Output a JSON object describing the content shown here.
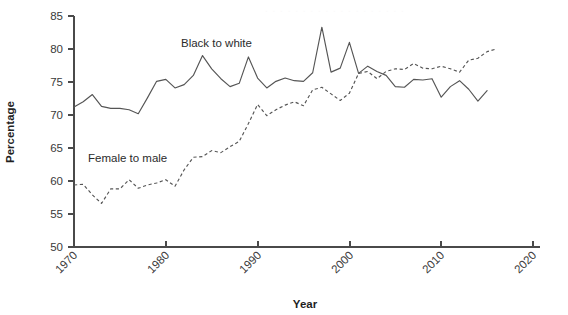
{
  "chart_data": {
    "type": "line",
    "title": "",
    "xlabel": "Year",
    "ylabel": "Percentage",
    "xlim": [
      1970,
      2020
    ],
    "ylim": [
      50,
      85
    ],
    "xticks": [
      1970,
      1980,
      1990,
      2000,
      2010,
      2020
    ],
    "xtick_labels": [
      "1970",
      "1980",
      "1990",
      "2000",
      "2010",
      "2020"
    ],
    "yticks": [
      50,
      55,
      60,
      65,
      70,
      75,
      80,
      85
    ],
    "ytick_labels": [
      "50",
      "55",
      "60",
      "65",
      "70",
      "75",
      "80",
      "85"
    ],
    "grid": false,
    "legend_position": "inline-annotation",
    "series": [
      {
        "name": "Black to white",
        "style": "solid",
        "color": "#555555",
        "annotation_label": "Black to white",
        "x": [
          1970,
          1971,
          1972,
          1973,
          1974,
          1975,
          1976,
          1977,
          1978,
          1979,
          1980,
          1981,
          1982,
          1983,
          1984,
          1985,
          1986,
          1987,
          1988,
          1989,
          1990,
          1991,
          1992,
          1993,
          1994,
          1995,
          1996,
          1997,
          1998,
          1999,
          2000,
          2001,
          2002,
          2003,
          2004,
          2005,
          2006,
          2007,
          2008,
          2009,
          2010,
          2011,
          2012,
          2013,
          2014,
          2015
        ],
        "values": [
          71.2,
          72.0,
          73.1,
          71.3,
          71.0,
          71.0,
          70.8,
          70.2,
          72.6,
          75.1,
          75.4,
          74.1,
          74.6,
          76.0,
          79.0,
          77.0,
          75.5,
          74.3,
          74.8,
          78.8,
          75.6,
          74.1,
          75.1,
          75.6,
          75.2,
          75.1,
          76.4,
          83.3,
          76.5,
          77.1,
          81.0,
          76.3,
          77.4,
          76.6,
          76.0,
          74.3,
          74.2,
          75.4,
          75.3,
          75.5,
          72.7,
          74.3,
          75.2,
          73.9,
          72.1,
          73.7
        ]
      },
      {
        "name": "Female to male",
        "style": "dashed",
        "color": "#555555",
        "annotation_label": "Female to male",
        "x": [
          1970,
          1971,
          1972,
          1973,
          1974,
          1975,
          1976,
          1977,
          1978,
          1979,
          1980,
          1981,
          1982,
          1983,
          1984,
          1985,
          1986,
          1987,
          1988,
          1989,
          1990,
          1991,
          1992,
          1993,
          1994,
          1995,
          1996,
          1997,
          1998,
          1999,
          2000,
          2001,
          2002,
          2003,
          2004,
          2005,
          2006,
          2007,
          2008,
          2009,
          2010,
          2011,
          2012,
          2013,
          2014,
          2015,
          2016
        ],
        "values": [
          59.4,
          59.5,
          57.9,
          56.6,
          58.8,
          58.8,
          60.2,
          58.9,
          59.4,
          59.7,
          60.2,
          59.2,
          61.7,
          63.6,
          63.7,
          64.6,
          64.3,
          65.2,
          66.0,
          68.7,
          71.6,
          69.9,
          70.8,
          71.5,
          72.0,
          71.4,
          73.8,
          74.2,
          73.2,
          72.2,
          73.3,
          76.3,
          76.6,
          75.5,
          76.6,
          77.0,
          76.9,
          77.8,
          77.1,
          77.0,
          77.4,
          77.0,
          76.5,
          78.3,
          78.6,
          79.6,
          80.0
        ]
      }
    ]
  },
  "annotations": {
    "black_to_white": {
      "label": "Black to white",
      "x_px": 181,
      "y_px": 47
    },
    "female_to_male": {
      "label": "Female to male",
      "x_px": 88,
      "y_px": 162
    }
  },
  "axes": {
    "x_title": "Year",
    "y_title": "Percentage"
  },
  "colors": {
    "line": "#555555",
    "axis": "#4a4a4a",
    "text": "#2b2b2b",
    "background": "#ffffff"
  }
}
